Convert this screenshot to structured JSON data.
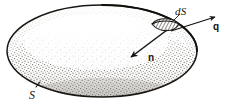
{
  "figure": {
    "kind": "vector-flux-diagram",
    "background_color": "#ffffff",
    "ink_color": "#14120f",
    "surface": {
      "label": "S",
      "shape": "ellipse",
      "center": [
        102,
        51
      ],
      "rx": 95,
      "ry": 46,
      "outline_color": "#1a1713",
      "fill_style": "stipple",
      "stipple_color": "#6f6a63",
      "highlight_color": "#fdfdfc",
      "shade_color": "#b8b3ab"
    },
    "area_element": {
      "label": "dS",
      "shape": "hatched-lens",
      "position": [
        166,
        27
      ],
      "hatch_color": "#23201b"
    },
    "normal_vector": {
      "label": "n",
      "from": [
        166,
        29
      ],
      "to": [
        130,
        57
      ],
      "label_position": [
        150,
        58
      ],
      "color": "#14120f"
    },
    "flux_vector": {
      "label": "q",
      "from": [
        172,
        30
      ],
      "to": [
        216,
        16
      ],
      "label_position": [
        214,
        28
      ],
      "color": "#14120f"
    },
    "surface_label": {
      "text": "S",
      "position": [
        31,
        95
      ],
      "tick_from": [
        37,
        86
      ],
      "tick_to": [
        40,
        82
      ]
    },
    "ds_label": {
      "text": "dS",
      "position": [
        176,
        8
      ]
    }
  }
}
